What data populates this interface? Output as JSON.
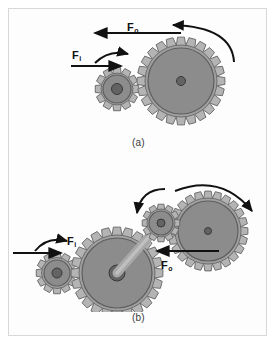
{
  "figure": {
    "background_color": "#ffffff",
    "frame_color": "#d8d8d8",
    "panels": [
      {
        "id": "a",
        "caption": "(a)",
        "description": "Simple gear train: small input gear meshed with large output gear",
        "labels": [
          {
            "name": "input-force",
            "symbol": "F",
            "subscript": "i",
            "text": "Fi"
          },
          {
            "name": "output-force",
            "symbol": "F",
            "subscript": "o",
            "text": "Fo"
          }
        ],
        "gears": [
          {
            "name": "small-input-gear",
            "cx": 108,
            "cy": 80,
            "teeth": 12,
            "outer_radius": 22,
            "root_radius": 16,
            "body_radius": 14,
            "hub_radius": 5.5
          },
          {
            "name": "large-output-gear",
            "cx": 172,
            "cy": 72,
            "teeth": 24,
            "outer_radius": 44,
            "root_radius": 36,
            "body_radius": 33,
            "hub_radius": 4.5
          }
        ],
        "rotation_arrows": [
          {
            "name": "small-gear-rotation-arrow",
            "direction": "clockwise"
          },
          {
            "name": "large-gear-rotation-arrow",
            "direction": "counterclockwise"
          }
        ],
        "force_arrows": [
          {
            "name": "input-force-arrow",
            "direction": "right"
          },
          {
            "name": "output-force-arrow",
            "direction": "left"
          }
        ]
      },
      {
        "id": "b",
        "caption": "(b)",
        "description": "Compound gear train: input pinion drives large gear on a shaft with a small gear that drives the output gear",
        "labels": [
          {
            "name": "input-force",
            "symbol": "F",
            "subscript": "i",
            "text": "Fi"
          },
          {
            "name": "output-force",
            "symbol": "F",
            "subscript": "o",
            "text": "Fo"
          }
        ],
        "gears": [
          {
            "name": "small-input-gear",
            "cx": 48,
            "cy": 92,
            "teeth": 12,
            "outer_radius": 21,
            "root_radius": 15.5,
            "body_radius": 13,
            "hub_radius": 5
          },
          {
            "name": "large-middle-gear",
            "cx": 108,
            "cy": 92,
            "teeth": 24,
            "outer_radius": 46,
            "root_radius": 38,
            "body_radius": 35,
            "hub_radius": 8
          },
          {
            "name": "small-shaft-gear",
            "cx": 152,
            "cy": 42,
            "teeth": 12,
            "outer_radius": 19,
            "root_radius": 14,
            "body_radius": 12,
            "hub_radius": 4
          },
          {
            "name": "large-output-gear",
            "cx": 199,
            "cy": 50,
            "teeth": 24,
            "outer_radius": 40,
            "root_radius": 33,
            "body_radius": 30,
            "hub_radius": 3.5
          }
        ],
        "shaft": {
          "name": "connecting-shaft",
          "from": "large-middle-gear",
          "to": "small-shaft-gear"
        },
        "rotation_arrows": [
          {
            "name": "small-input-gear-rotation-arrow",
            "direction": "clockwise"
          },
          {
            "name": "small-shaft-gear-rotation-arrow",
            "direction": "counterclockwise"
          },
          {
            "name": "large-output-gear-rotation-arrow",
            "direction": "clockwise"
          }
        ],
        "force_arrows": [
          {
            "name": "input-force-arrow",
            "direction": "right"
          },
          {
            "name": "output-force-arrow",
            "direction": "left"
          }
        ]
      }
    ],
    "colors": {
      "tooth_fill": "#b4b4b4",
      "tooth_stroke": "#6e6e6e",
      "rim_fill": "#a0a0a0",
      "body_fill": "#8c8c8c",
      "body_stroke": "#5e5e5e",
      "hub_fill": "#636363",
      "hub_stroke": "#3a3a3a",
      "shaft_fill": "#a8a8a8",
      "arrow_color": "#111111",
      "text_color": "#111111",
      "caption_color": "#3a3a3a"
    }
  }
}
